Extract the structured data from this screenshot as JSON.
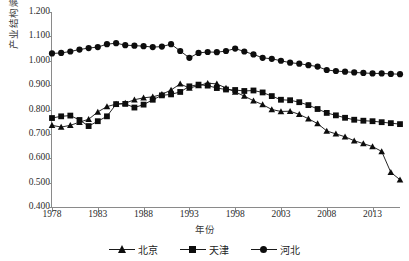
{
  "chart_data": {
    "type": "line",
    "title": "",
    "xlabel": "年份",
    "ylabel": "产业结构熵",
    "xlim": [
      1978,
      2016
    ],
    "ylim": [
      0.4,
      1.2
    ],
    "ytick_step": 0.1,
    "yticks": [
      "1.200",
      "1.100",
      "1.000",
      "0.900",
      "0.800",
      "0.700",
      "0.600",
      "0.500",
      "0.400"
    ],
    "ytick_values": [
      1.2,
      1.1,
      1.0,
      0.9,
      0.8,
      0.7,
      0.6,
      0.5,
      0.4
    ],
    "xticks": [
      "1978",
      "1983",
      "1988",
      "1993",
      "1998",
      "2003",
      "2008",
      "2013"
    ],
    "xtick_values": [
      1978,
      1983,
      1988,
      1993,
      1998,
      2003,
      2008,
      2013
    ],
    "grid": false,
    "legend_position": "bottom",
    "x": [
      1978,
      1979,
      1980,
      1981,
      1982,
      1983,
      1984,
      1985,
      1986,
      1987,
      1988,
      1989,
      1990,
      1991,
      1992,
      1993,
      1994,
      1995,
      1996,
      1997,
      1998,
      1999,
      2000,
      2001,
      2002,
      2003,
      2004,
      2005,
      2006,
      2007,
      2008,
      2009,
      2010,
      2011,
      2012,
      2013,
      2014,
      2015,
      2016
    ],
    "series": [
      {
        "name": "北京",
        "marker": "triangle",
        "color": "#0d0d0d",
        "values": [
          0.735,
          0.728,
          0.735,
          0.748,
          0.76,
          0.79,
          0.812,
          0.822,
          0.826,
          0.84,
          0.848,
          0.852,
          0.862,
          0.88,
          0.905,
          0.888,
          0.898,
          0.908,
          0.905,
          0.888,
          0.872,
          0.855,
          0.836,
          0.82,
          0.8,
          0.792,
          0.793,
          0.78,
          0.762,
          0.742,
          0.712,
          0.7,
          0.688,
          0.672,
          0.66,
          0.648,
          0.628,
          0.542,
          0.512
        ]
      },
      {
        "name": "天津",
        "marker": "square",
        "color": "#0d0d0d",
        "values": [
          0.765,
          0.772,
          0.775,
          0.757,
          0.732,
          0.752,
          0.772,
          0.822,
          0.823,
          0.808,
          0.82,
          0.84,
          0.858,
          0.862,
          0.872,
          0.895,
          0.902,
          0.898,
          0.888,
          0.882,
          0.88,
          0.876,
          0.878,
          0.87,
          0.855,
          0.84,
          0.838,
          0.83,
          0.818,
          0.802,
          0.786,
          0.776,
          0.766,
          0.758,
          0.754,
          0.752,
          0.748,
          0.744,
          0.74
        ]
      },
      {
        "name": "河北",
        "marker": "circle",
        "color": "#0d0d0d",
        "values": [
          1.03,
          1.032,
          1.038,
          1.046,
          1.052,
          1.056,
          1.068,
          1.072,
          1.064,
          1.062,
          1.06,
          1.056,
          1.058,
          1.068,
          1.04,
          1.012,
          1.032,
          1.036,
          1.035,
          1.04,
          1.05,
          1.038,
          1.026,
          1.012,
          1.008,
          1.0,
          0.992,
          0.988,
          0.982,
          0.976,
          0.962,
          0.958,
          0.955,
          0.952,
          0.95,
          0.948,
          0.948,
          0.946,
          0.945
        ]
      }
    ]
  },
  "legend": {
    "items": [
      {
        "label": "北京",
        "marker": "triangle"
      },
      {
        "label": "天津",
        "marker": "square"
      },
      {
        "label": "河北",
        "marker": "circle"
      }
    ]
  }
}
